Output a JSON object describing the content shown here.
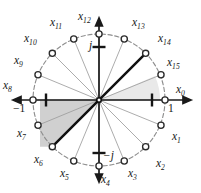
{
  "figure": {
    "type": "unit-circle-roots-of-unity",
    "center": {
      "x": 99,
      "y": 100
    },
    "radius": 66,
    "colors": {
      "background": "#ffffff",
      "axis": "#1a1a1a",
      "radial_line": "#9a9a9a",
      "arc": "#8f8f8f",
      "marker_stroke": "#2b2b2b",
      "marker_fill": "#ffffff",
      "bold_diameter": "#111111",
      "wedge_main": "#cfcfcf",
      "wedge_faint": "#e8e8e8",
      "text": "#171717"
    },
    "point_count": 16,
    "start_angle_deg": 0,
    "direction": "clockwise",
    "bold_diameter": {
      "from": "x6",
      "to": "x14"
    },
    "points": [
      {
        "id": "x0",
        "label": "x",
        "sub": "0",
        "angle_deg": 0,
        "lx": 176,
        "ly": 84
      },
      {
        "id": "x1",
        "label": "x",
        "sub": "1",
        "angle_deg": -22.5,
        "lx": 172,
        "ly": 131
      },
      {
        "id": "x2",
        "label": "x",
        "sub": "2",
        "angle_deg": -45,
        "lx": 156,
        "ly": 158
      },
      {
        "id": "x3",
        "label": "x",
        "sub": "3",
        "angle_deg": -67.5,
        "lx": 128,
        "ly": 168
      },
      {
        "id": "x4",
        "label": "x",
        "sub": "4",
        "angle_deg": -90,
        "lx": 101,
        "ly": 174
      },
      {
        "id": "x5",
        "label": "x",
        "sub": "5",
        "angle_deg": -112.5,
        "lx": 60,
        "ly": 168
      },
      {
        "id": "x6",
        "label": "x",
        "sub": "6",
        "angle_deg": -135,
        "lx": 34,
        "ly": 154
      },
      {
        "id": "x7",
        "label": "x",
        "sub": "7",
        "angle_deg": -157.5,
        "lx": 17,
        "ly": 128
      },
      {
        "id": "x8",
        "label": "x",
        "sub": "8",
        "angle_deg": 180,
        "lx": 3,
        "ly": 80
      },
      {
        "id": "x9",
        "label": "x",
        "sub": "9",
        "angle_deg": 157.5,
        "lx": 14,
        "ly": 55
      },
      {
        "id": "x10",
        "label": "x",
        "sub": "10",
        "angle_deg": 135,
        "lx": 24,
        "ly": 33
      },
      {
        "id": "x11",
        "label": "x",
        "sub": "11",
        "angle_deg": 112.5,
        "lx": 50,
        "ly": 17
      },
      {
        "id": "x12",
        "label": "x",
        "sub": "12",
        "angle_deg": 90,
        "lx": 78,
        "ly": 11
      },
      {
        "id": "x13",
        "label": "x",
        "sub": "13",
        "angle_deg": 67.5,
        "lx": 132,
        "ly": 17
      },
      {
        "id": "x14",
        "label": "x",
        "sub": "14",
        "angle_deg": 45,
        "lx": 158,
        "ly": 33
      },
      {
        "id": "x15",
        "label": "x",
        "sub": "15",
        "angle_deg": 22.5,
        "lx": 167,
        "ly": 57
      }
    ],
    "axis_labels": [
      {
        "id": "one",
        "text": "1",
        "italic": false,
        "lx": 168,
        "ly": 103
      },
      {
        "id": "minus-one",
        "text": "−1",
        "italic": false,
        "lx": 13,
        "ly": 103
      },
      {
        "id": "j",
        "text": "j",
        "italic": true,
        "lx": 89,
        "ly": 40
      },
      {
        "id": "minus-j",
        "text": "−j",
        "italic": true,
        "lx": 103,
        "ly": 150
      }
    ]
  }
}
